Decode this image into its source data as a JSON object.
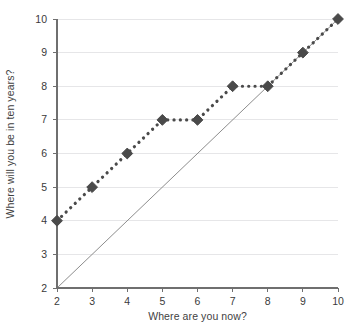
{
  "chart_data": {
    "type": "line",
    "title": "",
    "xlabel": "Where are you now?",
    "ylabel": "Where will you be in ten years?",
    "xlim": [
      2,
      10
    ],
    "ylim": [
      2,
      10
    ],
    "xticks": [
      2,
      3,
      4,
      5,
      6,
      7,
      8,
      9,
      10
    ],
    "yticks": [
      2,
      3,
      4,
      5,
      6,
      7,
      8,
      9,
      10
    ],
    "xtick_labels": [
      "2",
      "3",
      "4",
      "5",
      "6",
      "7",
      "8",
      "9",
      "10"
    ],
    "ytick_labels": [
      "2",
      "3",
      "4",
      "5",
      "6",
      "7",
      "8",
      "9",
      "10"
    ],
    "grid": "horizontal",
    "legend": "none",
    "series": [
      {
        "name": "responses",
        "marker": "diamond",
        "linestyle": "dotted",
        "color": "#4a4a4a",
        "x": [
          2,
          3,
          4,
          5,
          6,
          7,
          8,
          9,
          10
        ],
        "values": [
          4,
          5,
          6,
          7,
          7,
          8,
          8,
          9,
          10
        ]
      },
      {
        "name": "reference-line-y-equals-x",
        "marker": "none",
        "linestyle": "solid",
        "color": "#8d8d8d",
        "x": [
          2,
          10
        ],
        "values": [
          2,
          10
        ]
      }
    ],
    "annotations": []
  },
  "style": {
    "background": "#ffffff",
    "grid_color": "#e6e6e8",
    "axis_color": "#6f6f6f",
    "text_color": "#3a3a3a",
    "marker_color": "#4a4a4a",
    "reference_color": "#8d8d8d"
  }
}
